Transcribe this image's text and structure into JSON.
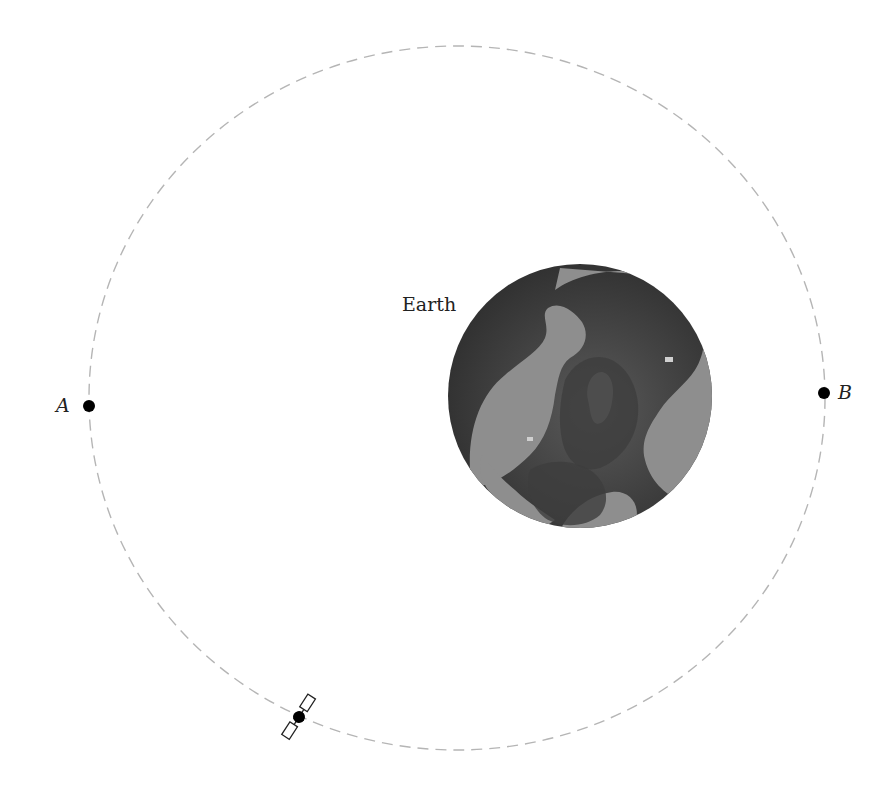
{
  "diagram": {
    "type": "orbit",
    "labels": {
      "earth": "Earth",
      "point_a": "A",
      "point_b": "B"
    },
    "orbit": {
      "shape": "ellipse",
      "style": "dashed",
      "color": "#b5b5b5"
    },
    "earth_body": {
      "ocean_color": "#4a4a4a",
      "land_color": "#8c8c8c"
    },
    "satellite": {
      "icon": "satellite-icon",
      "position": "lower-left of orbit"
    },
    "points": [
      {
        "name": "A",
        "side": "left"
      },
      {
        "name": "B",
        "side": "right"
      }
    ]
  }
}
